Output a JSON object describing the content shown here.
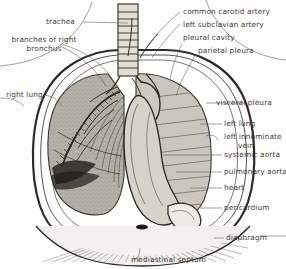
{
  "figure": {
    "ink_color": "#35322e",
    "paper_color": "#fdfdfc",
    "lung_tint": "#b9b4ab",
    "heart_tint": "#cfc9c0"
  },
  "labels": {
    "trachea": "trachea",
    "branches_of_right_bronchus_l1": "branches of right",
    "branches_of_right_bronchus_l2": "bronchus",
    "right_lung": "right lung",
    "common_carotid_artery": "common carotid artery",
    "left_subclavian_artery": "left subclavian artery",
    "pleural_cavity": "pleural cavity",
    "parietal_pleura": "parietal pleura",
    "visceral_pleura": "visceral pleura",
    "left_lung": "left lung",
    "left_innominate_vein_l1": "left innominate",
    "left_innominate_vein_l2": "vein",
    "systemic_aorta": "systemic aorta",
    "pulmonary_aorta": "pulmonary aorta",
    "heart": "heart",
    "pericardium": "pericardium",
    "diaphragm": "diaphragm",
    "mediastinal_septum": "mediastinal septum"
  },
  "structures": [
    "trachea",
    "right lung",
    "left lung",
    "heart",
    "diaphragm",
    "pericardium",
    "pleural cavity",
    "parietal pleura",
    "visceral pleura",
    "mediastinal septum",
    "common carotid artery",
    "left subclavian artery",
    "left innominate vein",
    "systemic aorta",
    "pulmonary aorta",
    "branches of right bronchus"
  ]
}
